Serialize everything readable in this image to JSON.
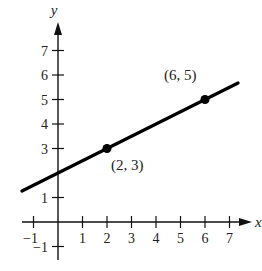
{
  "chart_data": {
    "type": "line",
    "title": "",
    "xlabel": "x",
    "ylabel": "y",
    "xlim": [
      -1.5,
      8
    ],
    "ylim": [
      -1.5,
      8
    ],
    "grid": false,
    "x_ticks": [
      -1,
      1,
      2,
      3,
      4,
      5,
      6,
      7
    ],
    "y_ticks": [
      -1,
      1,
      3,
      4,
      5,
      6,
      7
    ],
    "series": [
      {
        "name": "line",
        "equation": "y = 0.5x + 2",
        "slope": 0.5,
        "intercept": 2,
        "x_range": [
          -1.47,
          7.35
        ]
      }
    ],
    "points": [
      {
        "x": 2,
        "y": 3,
        "label": "(2, 3)"
      },
      {
        "x": 6,
        "y": 5,
        "label": "(6, 5)"
      }
    ]
  },
  "layout": {
    "origin_px": [
      58,
      222
    ],
    "unit_px": 24.5
  }
}
